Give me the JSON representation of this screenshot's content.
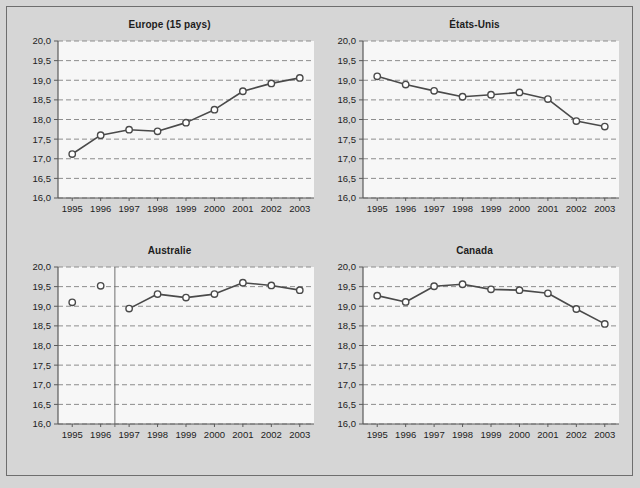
{
  "figure": {
    "background_color": "#d5d5d5",
    "frame_border_color": "#6e6e6e",
    "plot_background_color": "#f7f7f7",
    "gridline_color": "#8d8d8d",
    "axis_color": "#5a5a5a",
    "series_line_color": "#4a4a4a",
    "marker_fill_color": "#ffffff"
  },
  "axis": {
    "y_tick_labels": [
      "20,0",
      "19,5",
      "19,0",
      "18,5",
      "18,0",
      "17,5",
      "17,0",
      "16,5",
      "16,0"
    ],
    "x_tick_labels": [
      "1995",
      "1996",
      "1997",
      "1998",
      "1999",
      "2000",
      "2001",
      "2002",
      "2003"
    ]
  },
  "panels": [
    {
      "title": "Europe (15 pays)"
    },
    {
      "title": "États-Unis"
    },
    {
      "title": "Australie"
    },
    {
      "title": "Canada"
    }
  ],
  "chart_data": [
    {
      "type": "line",
      "title": "Europe (15 pays)",
      "xlabel": "",
      "ylabel": "",
      "x": [
        1995,
        1996,
        1997,
        1998,
        1999,
        2000,
        2001,
        2002,
        2003
      ],
      "xtick_labels": [
        "1995",
        "1996",
        "1997",
        "1998",
        "1999",
        "2000",
        "2001",
        "2002",
        "2003"
      ],
      "values": [
        17.12,
        17.6,
        17.74,
        17.7,
        17.92,
        18.25,
        18.72,
        18.92,
        19.06
      ],
      "ylim": [
        16.0,
        20.0
      ],
      "yticks": [
        16.0,
        16.5,
        17.0,
        17.5,
        18.0,
        18.5,
        19.0,
        19.5,
        20.0
      ],
      "ytick_labels": [
        "16,0",
        "16,5",
        "17,0",
        "17,5",
        "18,0",
        "18,5",
        "19,0",
        "19,5",
        "20,0"
      ],
      "grid": true,
      "legend": "none",
      "marker": "open-circle"
    },
    {
      "type": "line",
      "title": "États-Unis",
      "xlabel": "",
      "ylabel": "",
      "x": [
        1995,
        1996,
        1997,
        1998,
        1999,
        2000,
        2001,
        2002,
        2003
      ],
      "xtick_labels": [
        "1995",
        "1996",
        "1997",
        "1998",
        "1999",
        "2000",
        "2001",
        "2002",
        "2003"
      ],
      "values": [
        19.1,
        18.89,
        18.73,
        18.58,
        18.63,
        18.69,
        18.52,
        17.96,
        17.82
      ],
      "ylim": [
        16.0,
        20.0
      ],
      "yticks": [
        16.0,
        16.5,
        17.0,
        17.5,
        18.0,
        18.5,
        19.0,
        19.5,
        20.0
      ],
      "ytick_labels": [
        "16,0",
        "16,5",
        "17,0",
        "17,5",
        "18,0",
        "18,5",
        "19,0",
        "19,5",
        "20,0"
      ],
      "grid": true,
      "legend": "none",
      "marker": "open-circle"
    },
    {
      "type": "line",
      "title": "Australie",
      "xlabel": "",
      "ylabel": "",
      "x": [
        1995,
        1996,
        1997,
        1998,
        1999,
        2000,
        2001,
        2002,
        2003
      ],
      "xtick_labels": [
        "1995",
        "1996",
        "1997",
        "1998",
        "1999",
        "2000",
        "2001",
        "2002",
        "2003"
      ],
      "values": [
        19.1,
        19.52,
        18.94,
        19.31,
        19.22,
        19.31,
        19.6,
        19.53,
        19.41
      ],
      "segments": [
        [
          1995
        ],
        [
          1996
        ],
        [
          1997,
          1998,
          1999,
          2000,
          2001,
          2002,
          2003
        ]
      ],
      "break_line_at": 1996.5,
      "ylim": [
        16.0,
        20.0
      ],
      "yticks": [
        16.0,
        16.5,
        17.0,
        17.5,
        18.0,
        18.5,
        19.0,
        19.5,
        20.0
      ],
      "ytick_labels": [
        "16,0",
        "16,5",
        "17,0",
        "17,5",
        "18,0",
        "18,5",
        "19,0",
        "19,5",
        "20,0"
      ],
      "grid": true,
      "legend": "none",
      "marker": "open-circle"
    },
    {
      "type": "line",
      "title": "Canada",
      "xlabel": "",
      "ylabel": "",
      "x": [
        1995,
        1996,
        1997,
        1998,
        1999,
        2000,
        2001,
        2002,
        2003
      ],
      "xtick_labels": [
        "1995",
        "1996",
        "1997",
        "1998",
        "1999",
        "2000",
        "2001",
        "2002",
        "2003"
      ],
      "values": [
        19.27,
        19.11,
        19.51,
        19.56,
        19.43,
        19.41,
        19.33,
        18.93,
        18.55
      ],
      "ylim": [
        16.0,
        20.0
      ],
      "yticks": [
        16.0,
        16.5,
        17.0,
        17.5,
        18.0,
        18.5,
        19.0,
        19.5,
        20.0
      ],
      "ytick_labels": [
        "16,0",
        "16,5",
        "17,0",
        "17,5",
        "18,0",
        "18,5",
        "19,0",
        "19,5",
        "20,0"
      ],
      "grid": true,
      "legend": "none",
      "marker": "open-circle"
    }
  ]
}
